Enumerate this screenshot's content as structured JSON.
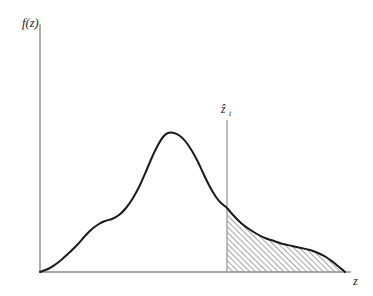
{
  "figure": {
    "kind": "probability-density-tail-plot",
    "background_color": "#ffffff",
    "axis_color": "#8a8a8a",
    "curve_color": "#1a1a1a",
    "hatch_color": "#2a2a2a",
    "threshold_line_color": "#9a9a9a"
  },
  "labels": {
    "ylabel": "f(z)",
    "xlabel": "z",
    "threshold_main": "ẑ",
    "threshold_sub": "t",
    "threshold_full": "ẑt"
  },
  "chart_data": {
    "type": "area",
    "title": "",
    "subtitle": "",
    "xlabel": "z",
    "ylabel": "f(z)",
    "grid": false,
    "legend": "none",
    "axis_origin_px": [
      40,
      272
    ],
    "axis_x_end_px": [
      350,
      272
    ],
    "axis_y_top_px": [
      40,
      25
    ],
    "xlim_px": [
      40,
      350
    ],
    "ylim_px": [
      272,
      25
    ],
    "threshold": {
      "label": "ẑt",
      "x_px": 227,
      "line_top_px": 120,
      "line_bottom_px": 272,
      "curve_value_px": 208
    },
    "shaded_region": {
      "description": "hatched tail area to the right of the threshold",
      "hatch_angle_deg": 45,
      "hatch_spacing_px": 4,
      "x_start_px": 227,
      "x_end_px": 345
    },
    "series": [
      {
        "name": "density",
        "description": "unimodal skewed density with left shoulder, single peak, long hatched right tail with secondary plateau",
        "points_px": [
          [
            40,
            272
          ],
          [
            50,
            268
          ],
          [
            60,
            261
          ],
          [
            70,
            252
          ],
          [
            78,
            244
          ],
          [
            85,
            236
          ],
          [
            92,
            229
          ],
          [
            99,
            224
          ],
          [
            105,
            221
          ],
          [
            112,
            219
          ],
          [
            119,
            215
          ],
          [
            126,
            208
          ],
          [
            133,
            198
          ],
          [
            140,
            185
          ],
          [
            147,
            169
          ],
          [
            153,
            155
          ],
          [
            158,
            145
          ],
          [
            163,
            137
          ],
          [
            168,
            133
          ],
          [
            174,
            133
          ],
          [
            180,
            136
          ],
          [
            186,
            142
          ],
          [
            192,
            151
          ],
          [
            198,
            162
          ],
          [
            204,
            175
          ],
          [
            210,
            187
          ],
          [
            216,
            197
          ],
          [
            221,
            203
          ],
          [
            227,
            208
          ],
          [
            234,
            216
          ],
          [
            241,
            223
          ],
          [
            249,
            229
          ],
          [
            257,
            234
          ],
          [
            265,
            238
          ],
          [
            274,
            241
          ],
          [
            283,
            244
          ],
          [
            292,
            246
          ],
          [
            301,
            248
          ],
          [
            310,
            250
          ],
          [
            318,
            253
          ],
          [
            326,
            257
          ],
          [
            333,
            262
          ],
          [
            339,
            267
          ],
          [
            344,
            271
          ],
          [
            345,
            272
          ]
        ]
      }
    ]
  }
}
